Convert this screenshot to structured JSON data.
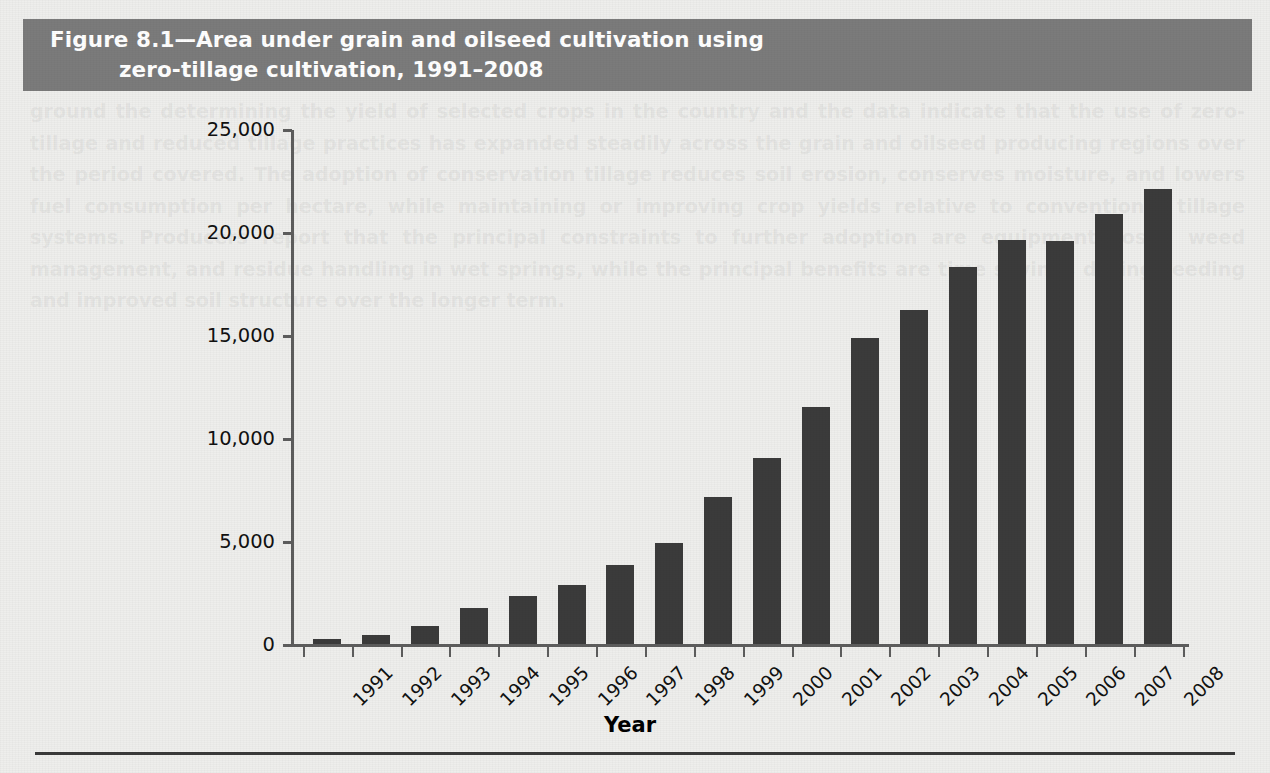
{
  "figure": {
    "banner": {
      "line1": "Figure 8.1—Area under grain and oilseed cultivation using",
      "line2": "zero-tillage cultivation, 1991–2008",
      "background_color": "#7b7b7b",
      "text_color": "#ffffff"
    },
    "page_background_color": "#eeeeec",
    "bar_color": "#3b3b3b",
    "axis_color": "#5d5d5d",
    "background_paragraph": "ground the determining the yield of selected crops in the country and the data indicate that the use of zero-tillage and reduced tillage practices has expanded steadily across the grain and oilseed producing regions over the period covered. The adoption of conservation tillage reduces soil erosion, conserves moisture, and lowers fuel consumption per hectare, while maintaining or improving crop yields relative to conventional tillage systems. Producers report that the principal constraints to further adoption are equipment costs, weed management, and residue handling in wet springs, while the principal benefits are time savings during seeding and improved soil structure over the longer term."
  },
  "chart_data": {
    "type": "bar",
    "title": "Figure 8.1—Area under grain and oilseed cultivation using zero-tillage cultivation, 1991–2008",
    "xlabel": "Year",
    "ylabel": "'000 Hectares",
    "ylim": [
      0,
      25000
    ],
    "ytick_labels": [
      "25,000",
      "20,000",
      "15,000",
      "10,000",
      "5,000",
      "0"
    ],
    "ytick_values": [
      25000,
      20000,
      15000,
      10000,
      5000,
      0
    ],
    "grid": false,
    "legend": false,
    "categories": [
      "1991",
      "1992",
      "1993",
      "1994",
      "1995",
      "1996",
      "1997",
      "1998",
      "1999",
      "2000",
      "2001",
      "2002",
      "2003",
      "2004",
      "2005",
      "2006",
      "2007",
      "2008"
    ],
    "values": [
      300,
      500,
      900,
      1800,
      2400,
      2900,
      3900,
      4950,
      7200,
      9100,
      11550,
      14900,
      16250,
      18350,
      19650,
      19600,
      20900,
      22150
    ]
  }
}
